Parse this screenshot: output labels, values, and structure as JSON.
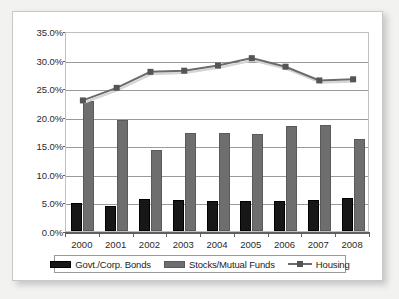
{
  "chart_data": {
    "type": "bar",
    "title": "",
    "subtitle": "",
    "xlabel": "",
    "ylabel": "",
    "categories": [
      "2000",
      "2001",
      "2002",
      "2003",
      "2004",
      "2005",
      "2006",
      "2007",
      "2008"
    ],
    "ylim": [
      0,
      35
    ],
    "ytick_values": [
      0,
      5,
      10,
      15,
      20,
      25,
      30,
      35
    ],
    "ytick_labels": [
      "0.0%",
      "5.0%",
      "10.0%",
      "15.0%",
      "20.0%",
      "25.0%",
      "30.0%",
      "35.0%"
    ],
    "grid": "horizontal",
    "legend_position": "bottom",
    "series": [
      {
        "name": "Govt./Corp. Bonds",
        "type": "bar",
        "color": "#171717",
        "values": [
          4.9,
          4.4,
          5.6,
          5.4,
          5.3,
          5.3,
          5.2,
          5.4,
          5.7
        ]
      },
      {
        "name": "Stocks/Mutual Funds",
        "type": "bar",
        "color": "#6e6e6e",
        "values": [
          22.8,
          19.4,
          14.2,
          17.1,
          17.2,
          17.0,
          18.3,
          18.6,
          16.1
        ]
      },
      {
        "name": "Housing",
        "type": "line",
        "color": "#6b6b6b",
        "marker": "square",
        "values": [
          23.2,
          25.4,
          28.2,
          28.4,
          29.3,
          30.6,
          29.1,
          26.7,
          26.9
        ]
      }
    ]
  },
  "legend": {
    "items": [
      {
        "label": "Govt./Corp. Bonds",
        "swatch": "bar-black-swatch"
      },
      {
        "label": "Stocks/Mutual Funds",
        "swatch": "bar-gray-swatch"
      },
      {
        "label": "Housing",
        "swatch": "line-marker-swatch"
      }
    ]
  },
  "colors": {
    "bonds": "#171717",
    "stocks": "#6e6e6e",
    "housing": "#6b6b6b",
    "gridline": "#9a9a9a",
    "axis": "#5f5f5f",
    "plot_background": "#ffffff",
    "card_background": "#ffffff",
    "mat_background": "#f2f2f0"
  }
}
